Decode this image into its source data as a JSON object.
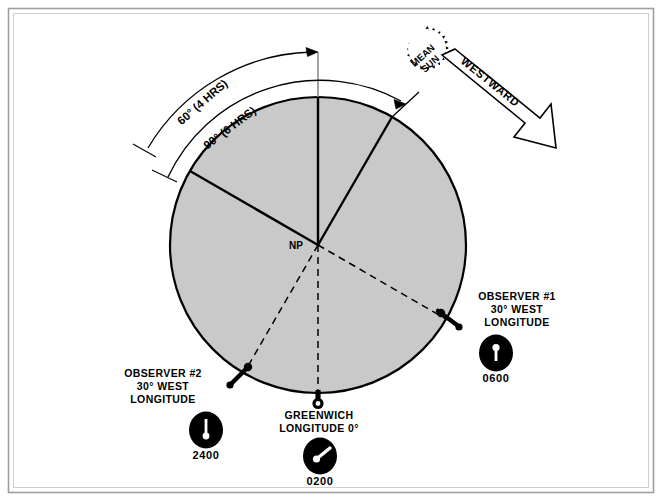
{
  "figure": {
    "background_color": "#ffffff",
    "border_color": "#9a9a9a",
    "earth_fill_color": "#c9c9c9",
    "earth_stroke_color": "#000000",
    "line_color": "#000000",
    "reference_line_color": "#8c8c8c"
  },
  "earth": {
    "center_label": "NP",
    "center_x": 318,
    "center_y": 245,
    "radius": 148
  },
  "sun": {
    "label_line_1": "MEAN",
    "label_line_2": "SUN",
    "fill": "#ffffff",
    "stroke": "#000000",
    "center_x": 424,
    "center_y": 62,
    "radius": 30
  },
  "direction_arrow": {
    "label": "WESTWARD",
    "fill": "#ffffff",
    "stroke": "#000000"
  },
  "arcs": [
    {
      "name": "arc-60",
      "label": "60° (4 HRS)",
      "degrees": 60,
      "hours": 4,
      "radius": 196
    },
    {
      "name": "arc-90",
      "label": "90° (6 HRS)",
      "degrees": 90,
      "hours": 6,
      "radius": 168
    }
  ],
  "markers": [
    {
      "name": "observer-1",
      "label_lines": [
        "OBSERVER  #1",
        "30°  WEST",
        "LONGITUDE"
      ],
      "clock_time": "0600",
      "longitude_deg": 30,
      "longitude_dir": "WEST",
      "hand_angle_deg": 180
    },
    {
      "name": "observer-2",
      "label_lines": [
        "OBSERVER  #2",
        "30°  WEST",
        "LONGITUDE"
      ],
      "clock_time": "2400",
      "longitude_deg": 30,
      "longitude_dir": "WEST",
      "hand_angle_deg": 0
    },
    {
      "name": "greenwich",
      "label_lines": [
        "GREENWICH",
        "LONGITUDE  0°"
      ],
      "clock_time": "0200",
      "longitude_deg": 0,
      "longitude_dir": "",
      "hand_angle_deg": 60
    }
  ]
}
